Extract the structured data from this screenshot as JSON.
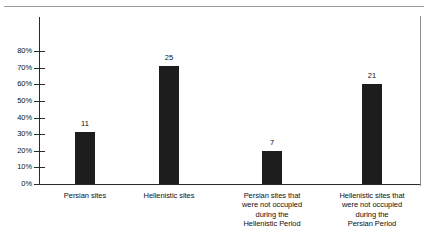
{
  "figure": {
    "top_rule": "horizontal-rule",
    "right_rule": "vertical-rule",
    "ghost_text": ""
  },
  "chart_data": {
    "type": "bar",
    "title": "",
    "subtitle": "",
    "xlabel": "",
    "ylabel": "",
    "ylim": [
      0,
      85
    ],
    "grid": false,
    "legend": null,
    "orientation": "vertical",
    "bar_color": "#1d1d1d",
    "axis_color": "#2b2b2b",
    "value_format": "count",
    "axis_format": "percent",
    "categories": [
      "Persian sites",
      "Hellenistic sites",
      "Persian sites that were not occupied during the Hellenistic Period",
      "Hellenistic sites that were not occupied during the Persian Period"
    ],
    "category_lines": [
      [
        "Persian sites"
      ],
      [
        "Hellenistic sites"
      ],
      [
        "Persian sites that",
        "were not occupied",
        "during the",
        "Hellenistic Period"
      ],
      [
        "Hellenistic sites that",
        "were not occupied",
        "during the",
        "Persian Period"
      ]
    ],
    "values": [
      31,
      71,
      20,
      60
    ],
    "data_labels": [
      "11",
      "25",
      "7",
      "21"
    ],
    "counts": [
      11,
      25,
      7,
      21
    ],
    "ytick_values": [
      0,
      10,
      20,
      30,
      40,
      50,
      60,
      70,
      80
    ],
    "ytick_labels": [
      "0%",
      "10%",
      "20%",
      "30%",
      "40%",
      "50%",
      "60%",
      "70%",
      "80%"
    ]
  }
}
